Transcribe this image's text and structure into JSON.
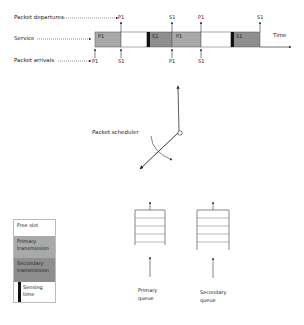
{
  "timeline": {
    "row_labels": {
      "departures": "Packet departures",
      "service": "Service",
      "arrivals": "Packet arrivals"
    },
    "time_label": "Time",
    "blocks": [
      {
        "type": "primary",
        "label": "P1",
        "x": 95,
        "w": 26
      },
      {
        "type": "free",
        "x": 121,
        "w": 26
      },
      {
        "type": "secondary",
        "label": "S1",
        "x": 147,
        "w": 25,
        "sensing": true
      },
      {
        "type": "primary",
        "label": "P1",
        "x": 172,
        "w": 29
      },
      {
        "type": "free",
        "x": 201,
        "w": 30
      },
      {
        "type": "secondary",
        "label": "S1",
        "x": 231,
        "w": 29,
        "sensing": true
      }
    ],
    "departures": [
      {
        "label": "P1",
        "x": 121
      },
      {
        "label": "S1",
        "x": 172
      },
      {
        "label": "P1",
        "x": 201
      },
      {
        "label": "S1",
        "x": 260
      }
    ],
    "arrivals": [
      {
        "label": "P1",
        "x": 95
      },
      {
        "label": "S1",
        "x": 121
      },
      {
        "label": "P1",
        "x": 172
      },
      {
        "label": "S1",
        "x": 201
      }
    ]
  },
  "scheduler": {
    "label": "Packet scheduler"
  },
  "queues": [
    {
      "label_line1": "Primary",
      "label_line2": "queue"
    },
    {
      "label_line1": "Secondary",
      "label_line2": "queue"
    }
  ],
  "legend": {
    "items": [
      {
        "label": "Free slot",
        "color": "#ffffff"
      },
      {
        "label_line1": "Primary",
        "label_line2": "transmission",
        "color": "#a9a9a9"
      },
      {
        "label_line1": "Secondary",
        "label_line2": "transmission",
        "color": "#8e8e8e"
      },
      {
        "label_line1": "Sensing",
        "label_line2": "time",
        "color": "#111111"
      }
    ]
  },
  "colors": {
    "primary": "#a9a9a9",
    "secondary": "#8e8e8e",
    "sensing": "#111111",
    "line": "#333333"
  }
}
